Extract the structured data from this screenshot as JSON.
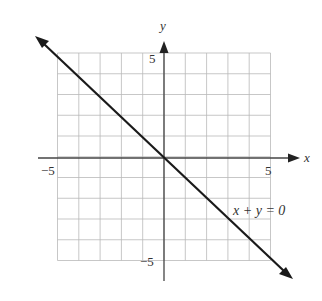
{
  "chart_data": {
    "type": "line",
    "title": "",
    "xlabel": "x",
    "ylabel": "y",
    "xlim": [
      -5,
      5
    ],
    "ylim": [
      -5,
      5
    ],
    "grid": true,
    "grid_step": 1,
    "x_ticks_labeled": [
      -5,
      5
    ],
    "y_ticks_labeled": [
      -5,
      5
    ],
    "tick_labels": {
      "x_neg": "−5",
      "x_pos": "5",
      "y_pos": "5",
      "y_neg": "−5"
    },
    "series": [
      {
        "name": "x + y = 0",
        "equation": "y = -x",
        "x": [
          -6,
          -5,
          0,
          5,
          6
        ],
        "y": [
          6,
          5,
          0,
          -5,
          -6
        ],
        "arrows_both_ends": true,
        "color": "#1a1a1a"
      }
    ],
    "annotations": [
      {
        "text": "x + y = 0",
        "x": 3.4,
        "y": -2.6
      }
    ],
    "legend": null
  },
  "axes": {
    "x_label": "x",
    "y_label": "y"
  },
  "colors": {
    "grid": "#b9b9b9",
    "axis": "#444444",
    "line": "#1a1a1a",
    "text": "#333333"
  }
}
